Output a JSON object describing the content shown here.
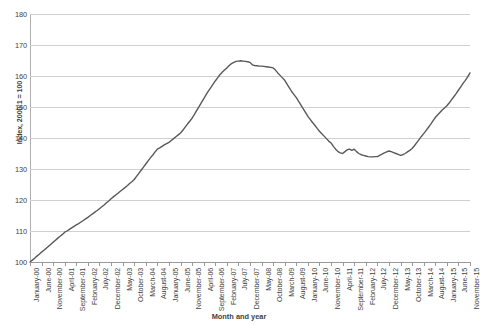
{
  "chart_data": {
    "type": "line",
    "title": "",
    "xlabel": "Month and year",
    "ylabel": "Index, 2000:1 = 100",
    "ylim": [
      100,
      180
    ],
    "yticks": [
      100,
      110,
      120,
      130,
      140,
      150,
      160,
      170,
      180
    ],
    "grid": true,
    "legend": "none",
    "line_color": "#595959",
    "categories": [
      "January-00",
      "June-00",
      "November-00",
      "April-01",
      "September-01",
      "February-02",
      "July-02",
      "December-02",
      "May-03",
      "October-03",
      "March-04",
      "August-04",
      "January-05",
      "June-05",
      "November-05",
      "April-06",
      "September-06",
      "February-07",
      "July-07",
      "December-07",
      "May-08",
      "October-08",
      "March-09",
      "August-09",
      "January-10",
      "June-10",
      "November-10",
      "April-11",
      "September-11",
      "February-12",
      "July-12",
      "December-12",
      "May-13",
      "October-13",
      "March-14",
      "August-14",
      "January-15",
      "June-15",
      "November-15"
    ],
    "series": [
      {
        "name": "Index",
        "values": [
          100.0,
          103.2,
          106.4,
          109.6,
          112.0,
          114.4,
          117.2,
          120.4,
          123.4,
          126.6,
          131.6,
          136.4,
          138.6,
          141.6,
          146.4,
          152.6,
          158.4,
          162.6,
          164.8,
          164.4,
          163.2,
          162.6,
          158.6,
          153.0,
          147.0,
          142.2,
          138.4,
          135.0,
          136.4,
          134.2,
          134.0,
          135.8,
          134.4,
          136.6,
          141.4,
          146.6,
          150.4,
          155.4,
          161.0
        ]
      }
    ],
    "monthly_values": [
      100.0,
      100.6,
      101.2,
      101.9,
      102.5,
      103.2,
      103.8,
      104.4,
      105.1,
      105.7,
      106.4,
      107.0,
      107.7,
      108.3,
      108.9,
      109.6,
      110.0,
      110.5,
      111.0,
      111.5,
      112.0,
      112.4,
      112.9,
      113.4,
      113.9,
      114.4,
      115.0,
      115.5,
      116.1,
      116.6,
      117.2,
      117.8,
      118.4,
      119.1,
      119.7,
      120.4,
      121.0,
      121.6,
      122.2,
      122.8,
      123.4,
      124.0,
      124.6,
      125.3,
      125.9,
      126.6,
      127.6,
      128.6,
      129.6,
      130.6,
      131.6,
      132.6,
      133.6,
      134.5,
      135.5,
      136.4,
      136.8,
      137.3,
      137.8,
      138.2,
      138.6,
      139.2,
      139.8,
      140.4,
      141.0,
      141.6,
      142.5,
      143.5,
      144.5,
      145.4,
      146.4,
      147.6,
      148.9,
      150.1,
      151.4,
      152.6,
      153.9,
      155.1,
      156.2,
      157.3,
      158.4,
      159.4,
      160.4,
      161.2,
      161.9,
      162.6,
      163.4,
      164.0,
      164.4,
      164.7,
      164.8,
      164.9,
      164.8,
      164.7,
      164.6,
      164.4,
      163.6,
      163.4,
      163.3,
      163.2,
      163.2,
      163.1,
      163.0,
      162.9,
      162.8,
      162.6,
      161.9,
      161.0,
      160.2,
      159.4,
      158.6,
      157.4,
      156.2,
      155.0,
      154.0,
      153.0,
      151.8,
      150.6,
      149.4,
      148.2,
      147.0,
      146.0,
      145.0,
      144.1,
      143.1,
      142.2,
      141.4,
      140.6,
      139.8,
      139.0,
      138.4,
      137.3,
      136.4,
      135.6,
      135.2,
      135.0,
      135.6,
      136.2,
      136.4,
      136.0,
      136.4,
      135.6,
      135.0,
      134.6,
      134.4,
      134.2,
      134.0,
      133.9,
      133.9,
      134.0,
      134.0,
      134.4,
      134.8,
      135.2,
      135.5,
      135.8,
      135.6,
      135.3,
      135.0,
      134.7,
      134.4,
      134.6,
      135.0,
      135.5,
      136.0,
      136.6,
      137.5,
      138.5,
      139.5,
      140.5,
      141.4,
      142.4,
      143.4,
      144.4,
      145.5,
      146.6,
      147.4,
      148.2,
      149.0,
      149.7,
      150.4,
      151.3,
      152.3,
      153.3,
      154.3,
      155.4,
      156.5,
      157.6,
      158.6,
      159.7,
      161.0
    ]
  }
}
